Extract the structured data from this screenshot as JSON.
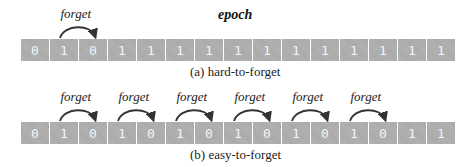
{
  "title": "epoch",
  "panels": [
    {
      "id": "a",
      "caption": "(a) hard-to-forget",
      "sequence": [
        "0",
        "1",
        "0",
        "1",
        "1",
        "1",
        "1",
        "1",
        "1",
        "1",
        "1",
        "1",
        "1",
        "1",
        "1"
      ],
      "forget_label": "forget",
      "forget_events": [
        [
          1,
          2
        ]
      ]
    },
    {
      "id": "b",
      "caption": "(b) easy-to-forget",
      "sequence": [
        "0",
        "1",
        "0",
        "1",
        "0",
        "1",
        "0",
        "1",
        "0",
        "1",
        "0",
        "1",
        "0",
        "1",
        "1"
      ],
      "forget_label": "forget",
      "forget_events": [
        [
          1,
          2
        ],
        [
          3,
          4
        ],
        [
          5,
          6
        ],
        [
          7,
          8
        ],
        [
          9,
          10
        ],
        [
          11,
          12
        ]
      ]
    }
  ],
  "colors": {
    "cell_bg": "#a9a9a9",
    "cell_text": "#f4f4f4",
    "arrow": "#333333"
  }
}
